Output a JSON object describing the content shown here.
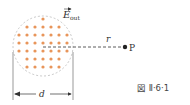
{
  "figure": {
    "caption": "図 Ⅱ·6·1",
    "field_label": "E",
    "field_subscript": "out",
    "distance_label": "r",
    "point_label": "P",
    "diameter_label": "d"
  },
  "colors": {
    "dots": "#e8955a",
    "circle_outline": "#bbbbbb",
    "lines": "#333333",
    "text": "#333333"
  }
}
